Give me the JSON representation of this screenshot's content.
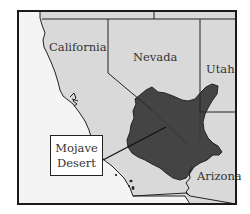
{
  "map": {
    "title": "Mojave Desert location map",
    "colors": {
      "land": "#d9d9d9",
      "ocean": "#f4f4f4",
      "desert": "#444444",
      "border": "#222222",
      "frame": "#1a1a1a",
      "label": "#333333"
    },
    "states": [
      {
        "name": "California",
        "label": "California"
      },
      {
        "name": "Nevada",
        "label": "Nevada"
      },
      {
        "name": "Utah",
        "label": "Utah"
      },
      {
        "name": "Arizona",
        "label": "Arizona"
      }
    ],
    "callout": {
      "line1": "Mojave",
      "line2": "Desert"
    }
  }
}
